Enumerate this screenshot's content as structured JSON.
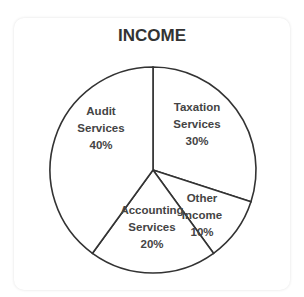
{
  "chart_data": {
    "type": "pie",
    "title": "INCOME",
    "slices": [
      {
        "label": "Taxation Services",
        "lines": [
          "Taxation",
          "Services",
          "30%"
        ],
        "value": 30
      },
      {
        "label": "Other Income",
        "lines": [
          "Other",
          "Income",
          "10%"
        ],
        "value": 10
      },
      {
        "label": "Accounting Services",
        "lines": [
          "Accounting",
          "Services",
          "20%"
        ],
        "value": 20
      },
      {
        "label": "Audit Services",
        "lines": [
          "Audit",
          "Services",
          "40%"
        ],
        "value": 40
      }
    ],
    "colors": {
      "fill": "#ffffff",
      "stroke": "#333333",
      "text": "#444444"
    }
  }
}
